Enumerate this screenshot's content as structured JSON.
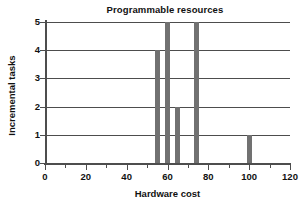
{
  "chart_data": {
    "type": "bar",
    "title": "Programmable resources",
    "xlabel": "Hardware cost",
    "ylabel": "Incremental tasks",
    "xlim": [
      0,
      120
    ],
    "ylim": [
      0,
      5
    ],
    "grid": true,
    "legend": null,
    "x_major_ticks": [
      0,
      20,
      40,
      60,
      80,
      100,
      120
    ],
    "x_minor_ticks": [
      10,
      30,
      50,
      70,
      90,
      110
    ],
    "x_tick_labels": [
      "0",
      "20",
      "40",
      "60",
      "80",
      "100",
      "120"
    ],
    "y_ticks": [
      0,
      1,
      2,
      3,
      4,
      5
    ],
    "y_tick_labels": [
      "0",
      "1",
      "2",
      "3",
      "4",
      "5"
    ],
    "bar_color": "#717171",
    "bars": [
      {
        "x": 55,
        "value": 4,
        "width": 2.2
      },
      {
        "x": 60,
        "value": 5,
        "width": 2.2
      },
      {
        "x": 65,
        "value": 2,
        "width": 2.2
      },
      {
        "x": 74,
        "value": 5,
        "width": 2.4
      },
      {
        "x": 100,
        "value": 1,
        "width": 2.4
      }
    ]
  },
  "figure": {
    "background": "#ffffff",
    "axis_color": "#4d4d4d",
    "text_color": "#111111"
  }
}
